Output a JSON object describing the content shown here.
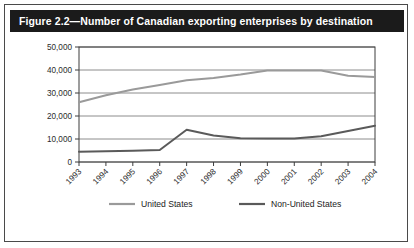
{
  "figure": {
    "title": "Figure 2.2—Number of Canadian exporting enterprises by destination"
  },
  "chart_data": {
    "type": "line",
    "title": "Figure 2.2—Number of Canadian exporting enterprises by destination",
    "xlabel": "",
    "ylabel": "",
    "x": [
      1993,
      1994,
      1995,
      1996,
      1997,
      1998,
      1999,
      2000,
      2001,
      2002,
      2003,
      2004
    ],
    "categories": [
      "1993",
      "1994",
      "1995",
      "1996",
      "1997",
      "1998",
      "1999",
      "2000",
      "2001",
      "2002",
      "2003",
      "2004"
    ],
    "series": [
      {
        "name": "United States",
        "color": "#9a9a9a",
        "values": [
          26000,
          29000,
          31500,
          33500,
          35500,
          36500,
          38000,
          39800,
          39800,
          39800,
          37500,
          37000
        ]
      },
      {
        "name": "Non-United States",
        "color": "#5a5a5a",
        "values": [
          4500,
          4700,
          4900,
          5200,
          14000,
          11500,
          10300,
          10200,
          10200,
          11200,
          13500,
          15800
        ]
      }
    ],
    "ylim": [
      0,
      50000
    ],
    "ytick_values": [
      0,
      10000,
      20000,
      30000,
      40000,
      50000
    ],
    "ytick_labels": [
      "0",
      "10,000",
      "20,000",
      "30,000",
      "40,000",
      "50,000"
    ],
    "grid": "horizontal",
    "legend_position": "bottom",
    "legend": [
      "United States",
      "Non-United States"
    ]
  }
}
